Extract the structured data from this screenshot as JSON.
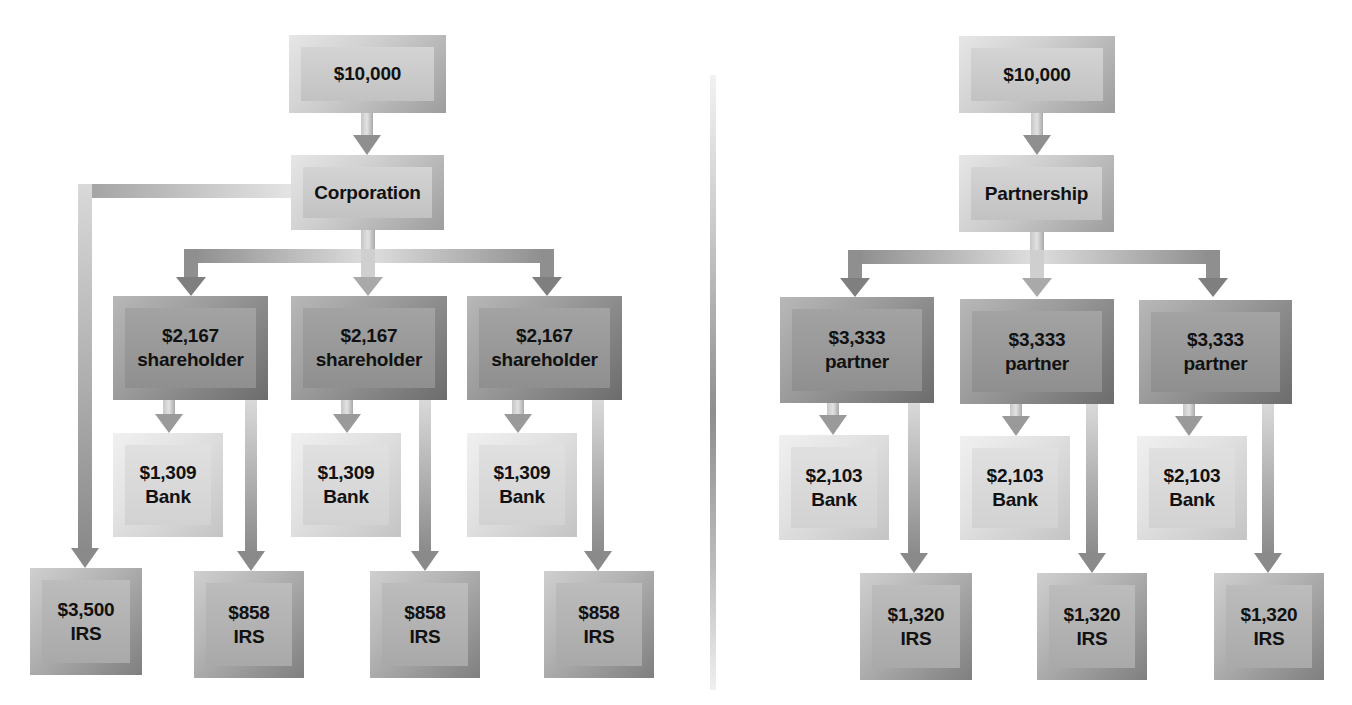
{
  "diagram": {
    "type": "flow",
    "left_panel": {
      "title": "Corporation tax flow",
      "source": {
        "label": "$10,000"
      },
      "entity": {
        "label": "Corporation"
      },
      "entity_tax": {
        "amount": "$3,500",
        "label": "IRS",
        "text": "$3,500\nIRS"
      },
      "owners": [
        {
          "text": "$2,167\nshareholder",
          "amount": "$2,167",
          "role": "shareholder",
          "bank": {
            "text": "$1,309\nBank",
            "amount": "$1,309"
          },
          "irs": {
            "text": "$858\nIRS",
            "amount": "$858"
          }
        },
        {
          "text": "$2,167\nshareholder",
          "amount": "$2,167",
          "role": "shareholder",
          "bank": {
            "text": "$1,309\nBank",
            "amount": "$1,309"
          },
          "irs": {
            "text": "$858\nIRS",
            "amount": "$858"
          }
        },
        {
          "text": "$2,167\nshareholder",
          "amount": "$2,167",
          "role": "shareholder",
          "bank": {
            "text": "$1,309\nBank",
            "amount": "$1,309"
          },
          "irs": {
            "text": "$858\nIRS",
            "amount": "$858"
          }
        }
      ]
    },
    "right_panel": {
      "title": "Partnership tax flow",
      "source": {
        "label": "$10,000"
      },
      "entity": {
        "label": "Partnership"
      },
      "owners": [
        {
          "text": "$3,333\npartner",
          "amount": "$3,333",
          "role": "partner",
          "bank": {
            "text": "$2,103\nBank",
            "amount": "$2,103"
          },
          "irs": {
            "text": "$1,320\nIRS",
            "amount": "$1,320"
          }
        },
        {
          "text": "$3,333\npartner",
          "amount": "$3,333",
          "role": "partner",
          "bank": {
            "text": "$2,103\nBank",
            "amount": "$2,103"
          },
          "irs": {
            "text": "$1,320\nIRS",
            "amount": "$1,320"
          }
        },
        {
          "text": "$3,333\npartner",
          "amount": "$3,333",
          "role": "partner",
          "bank": {
            "text": "$2,103\nBank",
            "amount": "$2,103"
          },
          "irs": {
            "text": "$1,320\nIRS",
            "amount": "$1,320"
          }
        }
      ]
    },
    "colors": {
      "background": "#ffffff",
      "box_light": "#c8c8c8",
      "box_dark": "#999999",
      "box_pale": "#dcdcdc",
      "arrow": "#8f8f8f",
      "text": "#111111"
    }
  }
}
